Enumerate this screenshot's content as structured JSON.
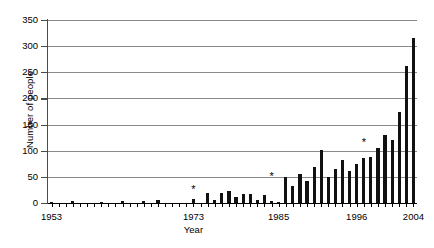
{
  "chart_data": {
    "type": "bar",
    "title": "",
    "xlabel": "Year",
    "ylabel": "Number of people",
    "ylim": [
      0,
      350
    ],
    "yticks": [
      0,
      50,
      100,
      150,
      200,
      250,
      300,
      350
    ],
    "xtick_labels": [
      "1953",
      "1973",
      "1985",
      "1996",
      "2004"
    ],
    "xtick_label_years": [
      1953,
      1973,
      1985,
      1996,
      2004
    ],
    "grid": "horizontal",
    "legend": "none",
    "categories": [
      1953,
      1954,
      1955,
      1956,
      1957,
      1958,
      1959,
      1960,
      1961,
      1962,
      1963,
      1964,
      1965,
      1966,
      1967,
      1968,
      1969,
      1970,
      1971,
      1972,
      1973,
      1974,
      1975,
      1976,
      1977,
      1978,
      1979,
      1980,
      1981,
      1982,
      1983,
      1984,
      1985,
      1986,
      1987,
      1988,
      1989,
      1990,
      1991,
      1992,
      1993,
      1994,
      1995,
      1996,
      1997,
      1998,
      1999,
      2000,
      2001,
      2002,
      2003,
      2004
    ],
    "values": [
      2,
      0,
      0,
      3,
      0,
      0,
      0,
      2,
      0,
      0,
      3,
      0,
      0,
      4,
      0,
      5,
      0,
      0,
      0,
      0,
      8,
      0,
      19,
      5,
      20,
      23,
      11,
      17,
      17,
      6,
      15,
      3,
      2,
      50,
      32,
      56,
      42,
      69,
      101,
      50,
      65,
      83,
      62,
      74,
      87,
      88,
      105,
      130,
      120,
      175,
      262,
      315
    ],
    "annotations": [
      {
        "label": "*",
        "year": 1973,
        "y": 33
      },
      {
        "label": "*",
        "year": 1984,
        "y": 58
      },
      {
        "label": "*",
        "year": 1997,
        "y": 123
      }
    ]
  }
}
